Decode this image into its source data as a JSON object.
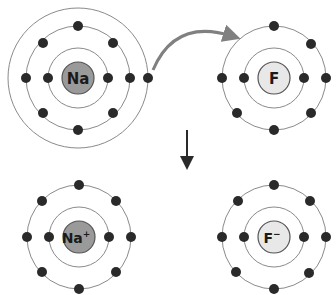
{
  "diagram": {
    "atoms": [
      {
        "id": "na",
        "label": "Na",
        "superscript": "",
        "cx": 78,
        "cy": 78,
        "orbits": [
          30,
          52,
          70
        ],
        "electrons_per_shell": [
          2,
          8,
          1
        ],
        "nucleus_color": "#9a9a9a"
      },
      {
        "id": "f",
        "label": "F",
        "superscript": "",
        "cx": 274,
        "cy": 78,
        "orbits": [
          30,
          52
        ],
        "electrons_per_shell": [
          2,
          7
        ],
        "nucleus_color": "#e8e8e8"
      },
      {
        "id": "na-ion",
        "label": "Na",
        "superscript": "+",
        "cx": 79,
        "cy": 237,
        "orbits": [
          30,
          52
        ],
        "electrons_per_shell": [
          2,
          8
        ],
        "nucleus_color": "#9a9a9a"
      },
      {
        "id": "f-ion",
        "label": "F",
        "superscript": "−",
        "cx": 274,
        "cy": 237,
        "orbits": [
          30,
          52
        ],
        "electrons_per_shell": [
          2,
          8
        ],
        "nucleus_color": "#e8e8e8"
      }
    ],
    "transfer_arrow": {
      "from": "Na outer electron",
      "to": "F outer shell",
      "color": "#808080"
    },
    "reaction_arrow": {
      "direction": "down",
      "color": "#2a2a2a"
    }
  }
}
